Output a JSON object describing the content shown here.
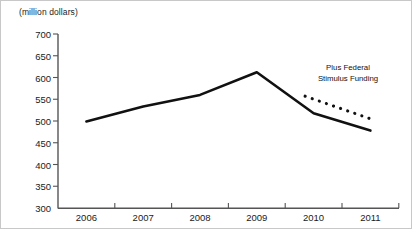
{
  "chart_data": {
    "type": "line",
    "title": "",
    "subtitle": "",
    "unit_label": "(million dollars)",
    "xlabel": "",
    "ylabel": "",
    "categories": [
      "2006",
      "2007",
      "2008",
      "2009",
      "2010",
      "2011"
    ],
    "x": [
      2006,
      2007,
      2008,
      2009,
      2010,
      2011
    ],
    "ylim": [
      300,
      700
    ],
    "ytick_step": 50,
    "yticks": [
      300,
      350,
      400,
      450,
      500,
      550,
      600,
      650,
      700
    ],
    "ytick_labels": [
      "300",
      "350",
      "400",
      "450",
      "500",
      "550",
      "600",
      "650",
      "700"
    ],
    "grid": false,
    "legend_position": "none",
    "series": [
      {
        "name": "Revenue",
        "style": "solid",
        "color": "#111111",
        "values": [
          499,
          533,
          560,
          612,
          518,
          478
        ]
      },
      {
        "name": "Plus Federal Stimulus Funding",
        "style": "dotted",
        "color": "#111111",
        "x": [
          2009.85,
          2011.0
        ],
        "values": [
          557,
          505
        ]
      }
    ],
    "annotations": [
      {
        "text": "Plus Federal Stimulus Funding",
        "line1": "Plus Federal",
        "line2": "Stimulus Funding",
        "x": 347,
        "y": 73
      }
    ]
  },
  "axis": {
    "y_axis_color": "#555555",
    "x_axis_color": "#555555",
    "tick_color": "#555555"
  }
}
